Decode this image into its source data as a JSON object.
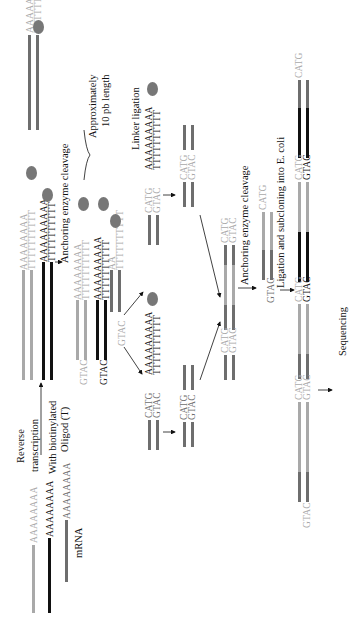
{
  "labels": {
    "reverse_transcription_1": "Reverse",
    "reverse_transcription_2": "transcription",
    "biotin_1": "With biotinylated",
    "biotin_2": "Oligod (T)",
    "mrna": "mRNA",
    "anchoring_1": "Anchoring enzyme cleavage",
    "approx_1": "Approximately",
    "approx_2": "10 pb length",
    "linker": "Linker ligation",
    "anchoring_2": "Anchoring enzyme cleavage",
    "ligation": "Ligation and subcloning into E. coli",
    "sequencing": "Sequencing"
  },
  "sequences": {
    "polyA": "AAAAAAAA",
    "polyA9": "AAAAAAAAA",
    "polyT": "TTTTTTTTTT",
    "catg": "CATG",
    "gtac": "GTAC",
    "aa": "AA"
  },
  "colors": {
    "light_strand": "#a9a9a9",
    "medium_strand": "#6e6e6e",
    "dark_strand": "#111111",
    "bead": "#777777"
  }
}
